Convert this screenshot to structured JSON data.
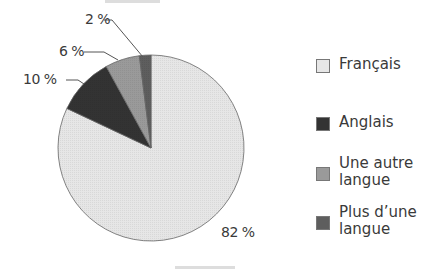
{
  "chart_data": {
    "type": "pie",
    "title": "",
    "categories": [
      "Français",
      "Anglais",
      "Une autre langue",
      "Plus d’une langue"
    ],
    "values": [
      82,
      10,
      6,
      2
    ],
    "unit": "%",
    "data_labels": [
      "82 %",
      "10 %",
      "6 %",
      "2 %"
    ],
    "colors": [
      "#e6e6e6",
      "#333333",
      "#9a9a9a",
      "#5e5e5e"
    ],
    "start_angle_deg": 0,
    "direction": "clockwise from 12 o'clock: Français, then counter-clockwise small slices Plus d’une langue, Une autre langue, Anglais",
    "legend_position": "right"
  },
  "labels": {
    "francais": "82 %",
    "anglais": "10 %",
    "autre": "6 %",
    "plusieurs": "2 %"
  },
  "legend": [
    {
      "label": "Français",
      "color": "#e6e6e6"
    },
    {
      "label": "Anglais",
      "color": "#333333"
    },
    {
      "label": "Une autre langue",
      "color": "#9a9a9a"
    },
    {
      "label": "Plus d’une langue",
      "color": "#5e5e5e"
    }
  ]
}
